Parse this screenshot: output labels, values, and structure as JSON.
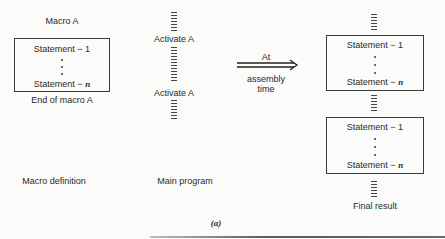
{
  "macro_definition": {
    "header": "Macro A",
    "statements": [
      "Statement − 1",
      "Statement − "
    ],
    "statement_n_var": "n",
    "footer": "End of macro A",
    "label": "Macro definition"
  },
  "main_program": {
    "calls": [
      "Activate A",
      "Activate A"
    ],
    "label": "Main program"
  },
  "arrow": {
    "label_top": "At",
    "label_bottom_1": "assembly",
    "label_bottom_2": "time"
  },
  "final_result": {
    "expansions": [
      {
        "first": "Statement − 1",
        "last": "Statement − ",
        "var": "n"
      },
      {
        "first": "Statement − 1",
        "last": "Statement − ",
        "var": "n"
      }
    ],
    "label": "Final result"
  },
  "caption": "(a)"
}
